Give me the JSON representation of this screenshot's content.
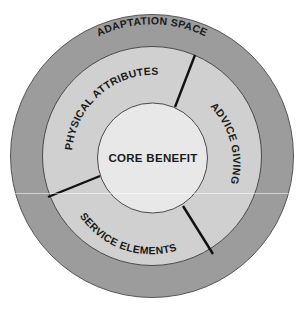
{
  "diagram": {
    "type": "concentric-rings",
    "outer_ring": {
      "label": "ADAPTATION SPACE",
      "color": "#9c9c9c"
    },
    "middle_ring": {
      "color": "#d0d0d0",
      "segments": [
        {
          "label": "PHYSICAL ATTRIBUTES",
          "position": "upper-left"
        },
        {
          "label": "ADVICE GIVING",
          "position": "right"
        },
        {
          "label": "SERVICE ELEMENTS",
          "position": "lower-left"
        }
      ],
      "divider_color": "#111111"
    },
    "core": {
      "label": "CORE BENEFIT",
      "color": "#e8e8e8"
    },
    "stroke_color": "#444444"
  }
}
